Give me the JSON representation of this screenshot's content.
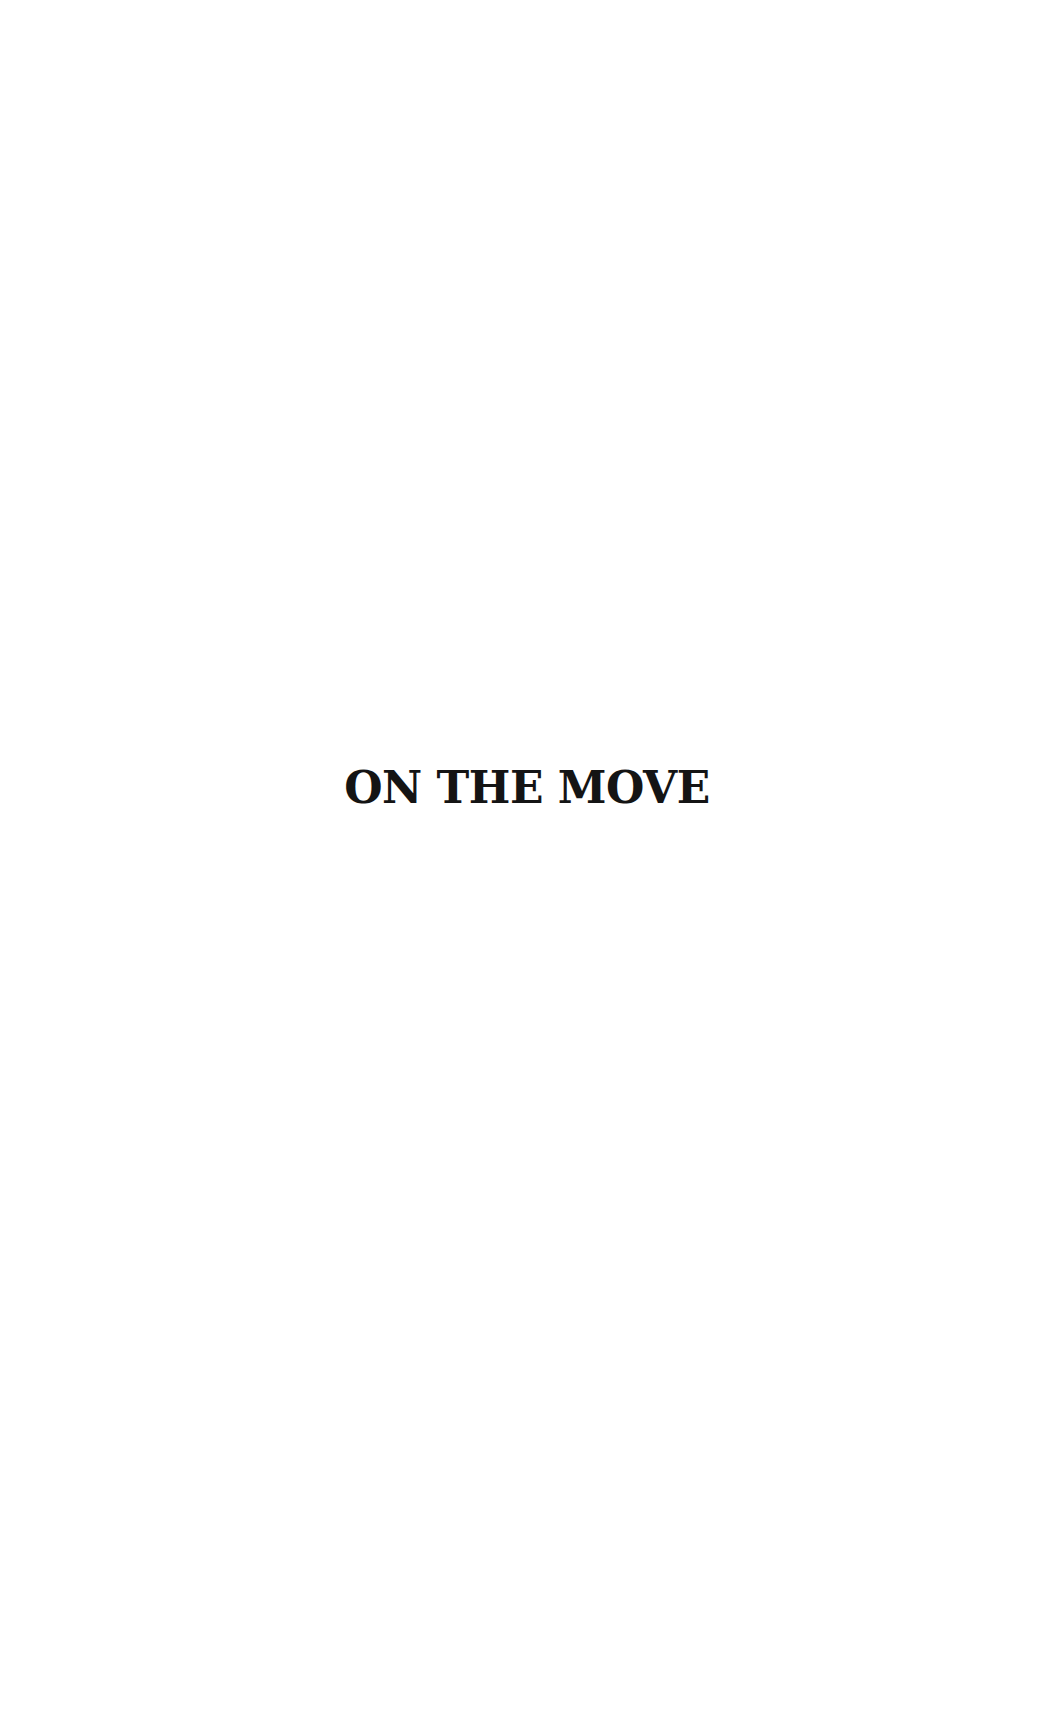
{
  "page": {
    "title": "ON THE MOVE"
  }
}
